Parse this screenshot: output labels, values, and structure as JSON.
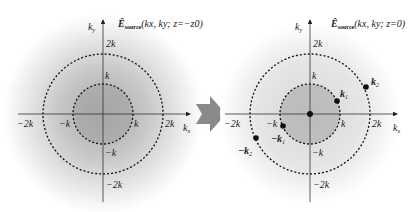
{
  "panels": [
    {
      "id": "left",
      "title_main": "Ê",
      "title_sub": "source",
      "title_args": "(kx, ky; z=−z0)",
      "axis_x": "kx",
      "axis_y": "ky",
      "ticks": {
        "pos_k": "k",
        "pos_2k": "2k",
        "neg_k": "−k",
        "neg_2k": "−2k"
      }
    },
    {
      "id": "right",
      "title_main": "Ê",
      "title_sub": "source",
      "title_args": "(kx, ky; z=0)",
      "axis_x": "kx",
      "axis_y": "ky",
      "ticks": {
        "pos_k": "k",
        "pos_2k": "2k",
        "neg_k": "−k",
        "neg_2k": "−2k"
      },
      "points": [
        {
          "label": "k1"
        },
        {
          "label": "k2"
        },
        {
          "label": "−k1"
        },
        {
          "label": "−k2"
        }
      ]
    }
  ],
  "arrow": {
    "color": "#8a8a8a",
    "meaning": "propagation"
  }
}
